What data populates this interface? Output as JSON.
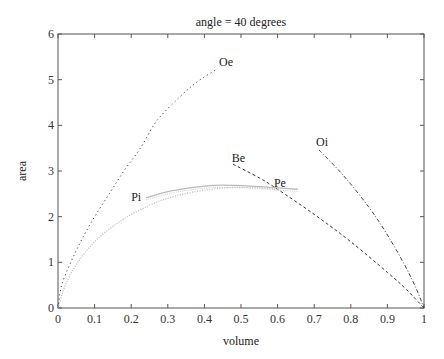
{
  "chart_data": {
    "type": "line",
    "title": "angle = 40 degrees",
    "xlabel": "volume",
    "ylabel": "area",
    "xlim": [
      0,
      1
    ],
    "ylim": [
      0,
      6
    ],
    "grid": false,
    "legend": "none (curves labeled inline)",
    "xticks": [
      "0",
      "0.1",
      "0.2",
      "0.3",
      "0.4",
      "0.5",
      "0.6",
      "0.7",
      "0.8",
      "0.9",
      "1"
    ],
    "yticks": [
      "0",
      "1",
      "2",
      "3",
      "4",
      "5",
      "6"
    ],
    "series": [
      {
        "name": "Oe",
        "style": "dotted",
        "color": "#444444",
        "x": [
          0,
          0.01,
          0.035,
          0.065,
          0.1,
          0.14,
          0.18,
          0.225,
          0.27,
          0.33,
          0.38,
          0.434
        ],
        "y": [
          0,
          0.5,
          1.0,
          1.5,
          2.0,
          2.5,
          3.0,
          3.5,
          4.1,
          4.6,
          4.95,
          5.23
        ],
        "label_pos": [
          0.44,
          5.3
        ]
      },
      {
        "name": "Be",
        "style": "dashed",
        "color": "#333333",
        "x": [
          0.478,
          0.55,
          0.6,
          0.7,
          0.8,
          0.9,
          0.95,
          1.0
        ],
        "y": [
          3.15,
          2.85,
          2.6,
          2.05,
          1.45,
          0.78,
          0.42,
          0.0
        ],
        "label_pos": [
          0.475,
          3.2
        ]
      },
      {
        "name": "Oi",
        "style": "dashdot",
        "color": "#444444",
        "x": [
          0.713,
          0.78,
          0.85,
          0.9,
          0.95,
          0.98,
          1.0
        ],
        "y": [
          3.46,
          2.9,
          2.2,
          1.6,
          0.9,
          0.4,
          0.0
        ],
        "label_pos": [
          0.705,
          3.55
        ]
      },
      {
        "name": "Pi",
        "style": "solid-light",
        "color": "#bbbbbb",
        "x": [
          0.24,
          0.3,
          0.35,
          0.4,
          0.45,
          0.5,
          0.55,
          0.6,
          0.655
        ],
        "y": [
          2.41,
          2.55,
          2.62,
          2.67,
          2.69,
          2.68,
          2.66,
          2.63,
          2.6
        ],
        "label_pos": [
          0.2,
          2.35
        ]
      },
      {
        "name": "Pe",
        "style": "dotted-light",
        "color": "#bbbbbb",
        "x": [
          0,
          0.02,
          0.05,
          0.1,
          0.17,
          0.25,
          0.32,
          0.4,
          0.48,
          0.55,
          0.6
        ],
        "y": [
          0,
          0.5,
          0.95,
          1.45,
          1.9,
          2.25,
          2.45,
          2.58,
          2.64,
          2.63,
          2.6
        ],
        "label_pos": [
          0.59,
          2.65
        ]
      }
    ]
  }
}
